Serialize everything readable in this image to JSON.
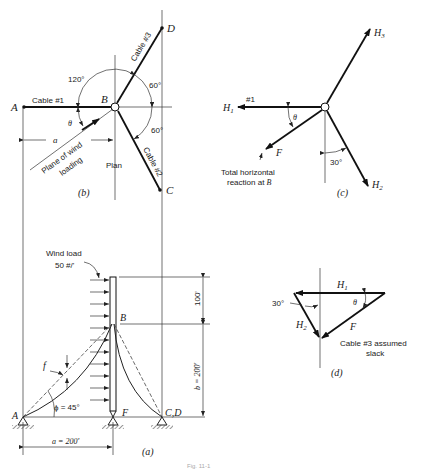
{
  "figure": {
    "caption": "Fig. 11-1",
    "panels": {
      "plan": {
        "label": "(b)",
        "view_label": "Plan",
        "points": {
          "A": "A",
          "B": "B",
          "C": "C",
          "D": "D"
        },
        "cables": {
          "cable1": "Cable #1",
          "cable2": "Cable #2",
          "cable3": "Cable #3"
        },
        "angles": {
          "a120": "120°",
          "a60_top": "60°",
          "a60_bottom": "60°",
          "theta": "θ"
        },
        "dimension_a": "a",
        "wind_plane": {
          "line1": "Plane of wind",
          "line2": "loading"
        }
      },
      "free_body": {
        "label": "(c)",
        "forces": {
          "H1": "H",
          "H1_sub": "1",
          "H2": "H",
          "H2_sub": "2",
          "H3": "H",
          "H3_sub": "3",
          "F": "F"
        },
        "cable_tag": "#1",
        "theta": "θ",
        "angle30": "30°",
        "note": {
          "line1": "Total horizontal",
          "line2": "reaction at",
          "point": "B"
        }
      },
      "elevation": {
        "label": "(a)",
        "wind_load": {
          "line1": "Wind load",
          "line2": "50 #/'"
        },
        "points": {
          "A": "A",
          "B": "B",
          "F": "F",
          "CD": "C,D"
        },
        "sag": "f",
        "phi": "ϕ = 45°",
        "dim_top": "100'",
        "dim_b": "b = 200'",
        "dim_a": "a = 200'"
      },
      "force_triangle": {
        "label": "(d)",
        "H1": "H",
        "H1_sub": "1",
        "H2": "H",
        "H2_sub": "2",
        "F": "F",
        "theta": "θ",
        "angle30": "30°",
        "note": {
          "line1": "Cable #3 assumed",
          "line2": "slack"
        }
      }
    }
  }
}
